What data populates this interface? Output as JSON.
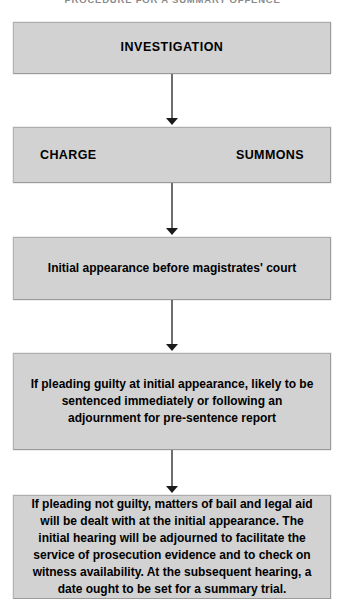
{
  "page": {
    "heading": "PROCEDURE FOR A SUMMARY OFFENCE"
  },
  "flowchart": {
    "type": "flowchart",
    "orientation": "top-to-bottom",
    "node_fill_color": "#d2d2d2",
    "node_border_color": "#9a9a9a",
    "connector_color": "#6e6e6e",
    "text_color": "#000000",
    "nodes": [
      {
        "id": "investigation",
        "label": "INVESTIGATION"
      },
      {
        "id": "charge-summons",
        "left_label": "CHARGE",
        "right_label": "SUMMONS"
      },
      {
        "id": "initial-appearance",
        "label": "Initial appearance before magistrates' court"
      },
      {
        "id": "guilty-plea",
        "label": "If pleading guilty at initial appearance, likely to be sentenced immediately or following an adjournment for pre-sentence report"
      },
      {
        "id": "not-guilty-plea",
        "label": "If pleading not guilty, matters of bail and legal aid will be dealt with at the initial appearance. The initial hearing will be adjourned to facilitate the service of prosecution evidence and to check on witness availability. At the subsequent hearing, a date ought to be set for a summary trial."
      }
    ],
    "edges": [
      {
        "id": "edge-1",
        "from": "investigation",
        "to": "charge-summons"
      },
      {
        "id": "edge-2",
        "from": "charge-summons",
        "to": "initial-appearance"
      },
      {
        "id": "edge-3",
        "from": "initial-appearance",
        "to": "guilty-plea"
      },
      {
        "id": "edge-4",
        "from": "guilty-plea",
        "to": "not-guilty-plea"
      }
    ]
  }
}
